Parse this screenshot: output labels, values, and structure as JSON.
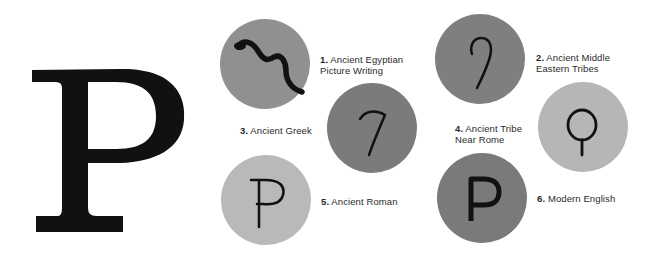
{
  "title_letter": "P",
  "stages": [
    {
      "number": "1.",
      "line1": "Ancient Egyptian",
      "line2": "Picture Writing",
      "glyph": "snake-glyph",
      "circle_color": "#909090"
    },
    {
      "number": "2.",
      "line1": "Ancient Middle",
      "line2": "Eastern Tribes",
      "glyph": "hook-glyph",
      "circle_color": "#7f7f7f"
    },
    {
      "number": "3.",
      "line1": "Ancient Greek",
      "line2": "",
      "glyph": "gamma-hook-glyph",
      "circle_color": "#7b7b7b"
    },
    {
      "number": "4.",
      "line1": "Ancient Tribe",
      "line2": "Near Rome",
      "glyph": "loop-stem-glyph",
      "circle_color": "#b6b6b6"
    },
    {
      "number": "5.",
      "line1": "Ancient Roman",
      "line2": "",
      "glyph": "roman-p-glyph",
      "circle_color": "#b9b9b9"
    },
    {
      "number": "6.",
      "line1": "Modern English",
      "line2": "",
      "glyph": "modern-p-glyph",
      "circle_color": "#7a7a7a"
    }
  ]
}
